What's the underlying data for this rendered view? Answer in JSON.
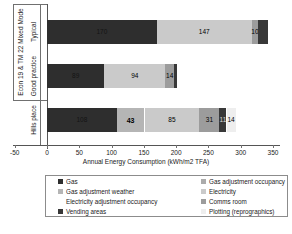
{
  "chart": {
    "xlabel": "Annual Energy Consumption (kWh/m2 TFA)",
    "group_label": "Econ 19 & TM 22 Mixed Mode"
  },
  "chart_data": {
    "type": "bar",
    "orientation": "horizontal",
    "stacked": true,
    "title": "",
    "xlabel": "Annual Energy Consumption (kWh/m2 TFA)",
    "xlim": [
      -50,
      350
    ],
    "xticks": [
      -50,
      0,
      50,
      100,
      150,
      200,
      250,
      300,
      350
    ],
    "categories": [
      "Typical",
      "Good practice",
      "Hills place"
    ],
    "category_group": {
      "label": "Econ 19 & TM 22 Mixed Mode",
      "spans": [
        "Typical",
        "Good practice"
      ]
    },
    "bars": [
      {
        "category": "Typical",
        "segments": [
          {
            "series": "Gas",
            "value": 170,
            "label": "170"
          },
          {
            "series": "Electricity",
            "value": 147,
            "label": "147"
          },
          {
            "series": "Comms room",
            "value": 10,
            "label": "10"
          },
          {
            "series": "Vending areas",
            "value": 15,
            "label": ""
          }
        ]
      },
      {
        "category": "Good practice",
        "segments": [
          {
            "series": "Gas",
            "value": 89,
            "label": "89"
          },
          {
            "series": "Electricity",
            "value": 94,
            "label": "94"
          },
          {
            "series": "Comms room",
            "value": 14,
            "label": "14"
          },
          {
            "series": "Vending areas",
            "value": 5,
            "label": ""
          }
        ]
      },
      {
        "category": "Hills place",
        "segments": [
          {
            "series": "Gas",
            "value": 108,
            "label": "108"
          },
          {
            "series": "Gas adjustment weather",
            "value": 43,
            "label": "43",
            "bold": true
          },
          {
            "series": "Electricity",
            "value": 85,
            "label": "85"
          },
          {
            "series": "Comms room",
            "value": 31,
            "label": "31"
          },
          {
            "series": "Vending areas",
            "value": 11,
            "label": "11",
            "light_label": true
          },
          {
            "series": "Plotting (reprographics)",
            "value": 14,
            "label": "14"
          }
        ]
      }
    ]
  },
  "legend": {
    "items": [
      {
        "label": "Gas",
        "color": "#2e2e2e"
      },
      {
        "label": "Gas adjustment occupancy",
        "color": "#ababab"
      },
      {
        "label": "Gas adjustment weather",
        "color": "#b5b5b5"
      },
      {
        "label": "Electricity",
        "color": "#cacaca"
      },
      {
        "label": "Electricity adjustment occupancy",
        "color": "#ffffff"
      },
      {
        "label": "Comms room",
        "color": "#9c9c9c"
      },
      {
        "label": "Vending areas",
        "color": "#383838"
      },
      {
        "label": "Plotting (reprographics)",
        "color": "#eeeeee"
      }
    ]
  }
}
